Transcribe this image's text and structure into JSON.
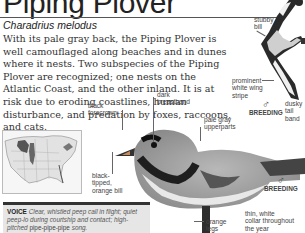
{
  "header": {
    "title": "Piping Plover",
    "scientific_name": "Charadrius melodus"
  },
  "description": "With its pale gray back, the Piping Plover is well camouflaged along beaches and in dunes where it nests. Two subspecies of the Piping Plover are recognized; one nests on the Atlantic Coast, and the other inland. It is at risk due to eroding coastlines, human disturbance, and predation by foxes, raccoons, and cats.",
  "annotations": {
    "stubby_bill": "stubby\nbill",
    "white_wing_stripe": "prominent\nwhite wing\nstripe",
    "dusky_tail_band": "dusky\ntail\nband",
    "black_forecrown": "black\nforecrown",
    "dark_breastband": "dark\nbreastband",
    "pale_gray_upperparts": "pale gray\nupperparts",
    "bill_tip": "black-\ntipped,\norange bill",
    "orange_legs": "orange\nlegs",
    "white_collar": "thin, white\ncollar throughout\nthe year"
  },
  "plumage_tags": [
    {
      "symbol": "♂",
      "label": "BREEDING"
    },
    {
      "symbol": "♂",
      "label": "BREEDING"
    }
  ],
  "voice": {
    "heading": "VOICE",
    "part1": "Clear, whistled peep call in flight; quiet peep-lo during courtship and contact; high-pitched",
    "song": "pipe-pipe-pipe",
    "part2": "song."
  },
  "map": {
    "label": "range map"
  }
}
